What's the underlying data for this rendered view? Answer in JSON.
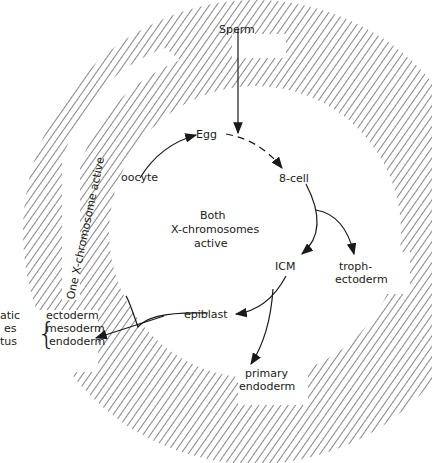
{
  "diagram": {
    "outer_band_label": "One X-chromosome active",
    "center_label": [
      "Both",
      "X-chromosomes",
      "active"
    ],
    "nodes": {
      "sperm": "Sperm",
      "egg": "Egg",
      "oocyte": "oocyte",
      "cell8": "8-cell",
      "icm": "ICM",
      "epiblast": "epiblast",
      "trophectoderm": [
        "troph-",
        "ectoderm"
      ],
      "primary_endoderm": [
        "primary",
        "endoderm"
      ]
    },
    "germ_layers": [
      "ectoderm",
      "mesoderm",
      "endoderm"
    ],
    "truncated_left_labels": [
      "atic",
      "es",
      "tus"
    ],
    "colors": {
      "hatch": "#444444",
      "text": "#1a1a1a",
      "background": "#ffffff"
    }
  }
}
